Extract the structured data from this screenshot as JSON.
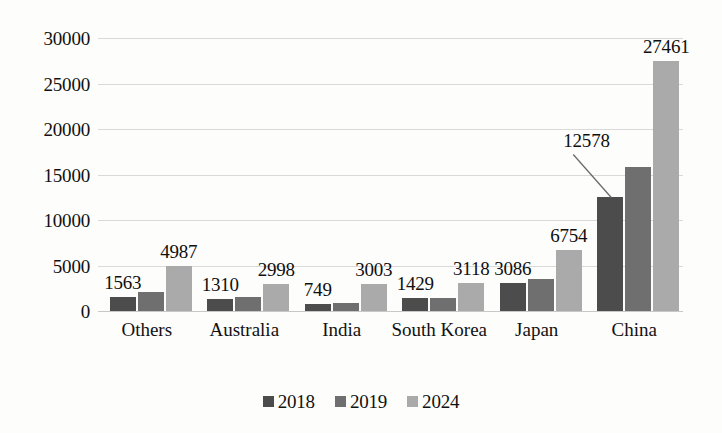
{
  "chart_data": {
    "type": "bar",
    "title": "",
    "subtitle": "",
    "xlabel": "",
    "ylabel": "",
    "ylim": [
      0,
      30000
    ],
    "ytick_step": 5000,
    "ytick_labels": [
      "0",
      "5000",
      "10000",
      "15000",
      "20000",
      "25000",
      "30000"
    ],
    "grid": true,
    "legend_position": "bottom",
    "categories": [
      "Others",
      "Australia",
      "India",
      "South Korea",
      "Japan",
      "China"
    ],
    "series": [
      {
        "name": "2018",
        "color": "#4c4c4c",
        "values": [
          1563,
          1310,
          749,
          1429,
          3086,
          12578
        ],
        "labels": [
          "1563",
          "1310",
          "749",
          "1429",
          "3086",
          "12578"
        ]
      },
      {
        "name": "2019",
        "color": "#6f6f6f",
        "values": [
          2080,
          1500,
          880,
          1430,
          3500,
          15800
        ],
        "labels": [
          "",
          "",
          "",
          "",
          "",
          ""
        ]
      },
      {
        "name": "2024",
        "color": "#aaaaaa",
        "values": [
          4987,
          2998,
          3003,
          3118,
          6754,
          27461
        ],
        "labels": [
          "4987",
          "2998",
          "3003",
          "3118",
          "6754",
          "27461"
        ]
      }
    ],
    "annotations": [
      {
        "text": "12578",
        "series": "2018",
        "category": "China",
        "style": "leader-line"
      }
    ]
  },
  "legend": {
    "items": [
      {
        "label": "2018",
        "color": "#4c4c4c"
      },
      {
        "label": "2019",
        "color": "#6f6f6f"
      },
      {
        "label": "2024",
        "color": "#aaaaaa"
      }
    ]
  }
}
